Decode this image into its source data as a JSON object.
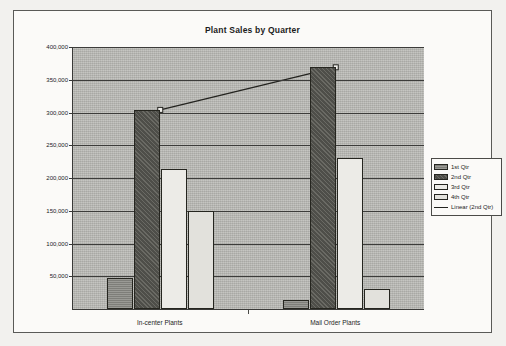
{
  "chart_data": {
    "type": "bar",
    "title": "Plant Sales by Quarter",
    "xlabel": "",
    "ylabel": "",
    "categories": [
      "In-center Plants",
      "Mail Order Plants"
    ],
    "series": [
      {
        "name": "1st Qtr",
        "values": [
          48000,
          14000
        ]
      },
      {
        "name": "2nd Qtr",
        "values": [
          304000,
          369000
        ]
      },
      {
        "name": "3rd Qtr",
        "values": [
          214000,
          230000
        ]
      },
      {
        "name": "4th Qtr",
        "values": [
          149000,
          31000
        ]
      },
      {
        "name": "Linear (2nd Qtr)",
        "type": "trendline",
        "values": [
          304000,
          369000
        ]
      }
    ],
    "ylim": [
      0,
      400000
    ],
    "ytick_values": [
      400000,
      350000,
      300000,
      250000,
      200000,
      150000,
      100000,
      50000
    ],
    "ytick_labels": [
      "400,000",
      "350,000",
      "300,000",
      "250,000",
      "200,000",
      "150,000",
      "100,000",
      "50,000"
    ],
    "grid": true,
    "legend_position": "right",
    "colors": {
      "plot_background": "#b9b9b4",
      "chart_background": "#fbfaf8",
      "axis": "#3a3a38",
      "q1": "#8e8e89",
      "q2": "#5c5c57",
      "q3": "#ecebe7",
      "q4": "#e2e1dc",
      "trendline": "#23231f"
    }
  },
  "legend": {
    "items": [
      {
        "label": "1st Qtr",
        "swatch": "q1"
      },
      {
        "label": "2nd Qtr",
        "swatch": "q2"
      },
      {
        "label": "3rd Qtr",
        "swatch": "q3"
      },
      {
        "label": "4th Qtr",
        "swatch": "q4"
      },
      {
        "label": "Linear (2nd Qtr)",
        "swatch": "line"
      }
    ]
  }
}
